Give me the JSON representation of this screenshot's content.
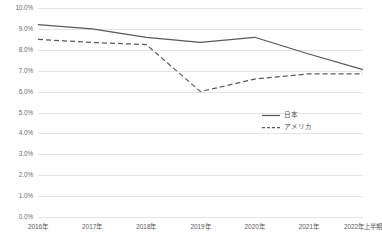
{
  "chart_data": {
    "type": "line",
    "title": "",
    "xlabel": "",
    "ylabel": "",
    "categories": [
      "2016年",
      "2017年",
      "2018年",
      "2019年",
      "2020年",
      "2021年",
      "2022年上半期"
    ],
    "series": [
      {
        "name": "日本",
        "style": "solid",
        "color": "#595959",
        "values": [
          9.2,
          9.0,
          8.6,
          8.35,
          8.6,
          7.8,
          7.05
        ]
      },
      {
        "name": "アメリカ",
        "style": "dashed",
        "color": "#595959",
        "values": [
          8.5,
          8.35,
          8.25,
          6.0,
          6.6,
          6.85,
          6.85
        ]
      }
    ],
    "ylim": [
      0,
      10
    ],
    "ytick_values": [
      0,
      1,
      2,
      3,
      4,
      5,
      6,
      7,
      8,
      9,
      10
    ],
    "ytick_labels": [
      "0.0%",
      "1.0%",
      "2.0%",
      "3.0%",
      "4.0%",
      "5.0%",
      "6.0%",
      "7.0%",
      "8.0%",
      "9.0%",
      "10.0%"
    ],
    "grid": true,
    "grid_color": "#e4e4e4",
    "legend_position": "center-right",
    "background": "#ffffff"
  }
}
